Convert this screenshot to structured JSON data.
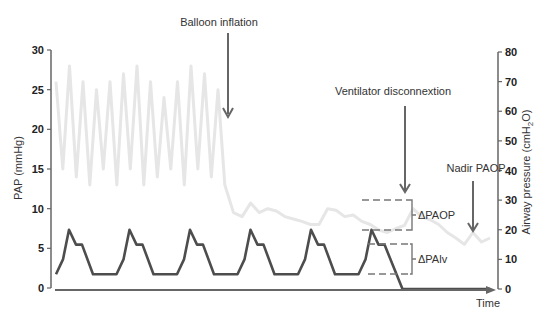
{
  "chart_data": {
    "type": "line",
    "title": "",
    "xlabel": "Time",
    "ylabel_left": "PAP (mmHg)",
    "ylabel_right": "Airway pressure (cmH2O)",
    "ylim_left": [
      0,
      30
    ],
    "ylim_right": [
      0,
      80
    ],
    "yticks_left": [
      0,
      5,
      10,
      15,
      20,
      25,
      30
    ],
    "yticks_right": [
      0,
      10,
      20,
      30,
      40,
      50,
      60,
      70,
      80
    ],
    "grid": false,
    "legend": null,
    "colors": {
      "pap": "#e6e6e6",
      "airway": "#555555",
      "axis": "#666666",
      "annotation": "#666666"
    },
    "series": [
      {
        "name": "PAP (pulmonary artery pressure)",
        "axis": "left",
        "color": "#e6e6e6",
        "x": [
          0,
          1,
          2,
          3,
          4,
          5,
          6,
          7,
          8,
          9,
          10,
          11,
          12,
          13,
          14,
          15,
          16,
          17,
          18,
          19,
          20,
          21,
          22,
          23,
          24,
          25,
          26,
          27,
          28,
          29,
          30,
          31,
          32,
          33,
          34,
          35,
          36,
          37,
          38,
          39,
          40,
          41,
          42,
          43,
          44,
          45,
          46,
          47,
          48,
          49,
          50,
          51,
          52,
          53,
          54,
          55,
          56
        ],
        "values": [
          26,
          15,
          28,
          14,
          26,
          13,
          25,
          15,
          26,
          13,
          27,
          15,
          28,
          13,
          26,
          14,
          24,
          15,
          26,
          13,
          28,
          15,
          27,
          14,
          25,
          13,
          9.5,
          9,
          10.7,
          9.5,
          10,
          9.7,
          9,
          8.7,
          8.4,
          8,
          8,
          10,
          9.8,
          9,
          9.2,
          8.4,
          8,
          7.3,
          7,
          7.5,
          7.9,
          10,
          9,
          8.6,
          8,
          7,
          6.3,
          5.5,
          7,
          5.8,
          6.3
        ]
      },
      {
        "name": "Airway pressure",
        "axis": "right",
        "color": "#555555",
        "cycle_shape": {
          "baseline": 5,
          "rise_mid": 10,
          "peak": 20,
          "plateau": 15
        },
        "cycles": 6,
        "post_disconnection_value": 0
      }
    ],
    "annotations": [
      {
        "text": "Balloon inflation",
        "type": "arrow-down"
      },
      {
        "text": "Ventilator disconnextion",
        "type": "arrow-down"
      },
      {
        "text": "Nadir PAOP",
        "type": "arrow-down"
      },
      {
        "text": "ΔPAOP",
        "type": "bracket",
        "range_right_axis": [
          20,
          30
        ]
      },
      {
        "text": "ΔPAlv",
        "type": "bracket",
        "range_right_axis": [
          5,
          15
        ]
      }
    ]
  },
  "labels": {
    "balloon_inflation": "Balloon inflation",
    "ventilator_disconnection": "Ventilator disconnextion",
    "nadir_paop": "Nadir PAOP",
    "delta_paop": "ΔPAOP",
    "delta_palv": "ΔPAlv",
    "x_axis": "Time",
    "y_left": "PAP (mmHg)",
    "y_right_prefix": "Airway pressure (cmH",
    "y_right_sub": "2",
    "y_right_suffix": "O)"
  }
}
